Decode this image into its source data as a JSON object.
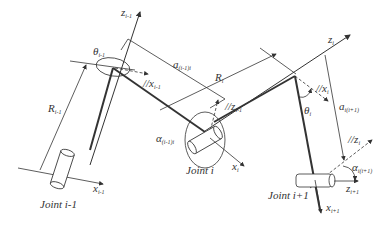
{
  "diagram": {
    "type": "robot-kinematics-dh-parameters",
    "joints": [
      {
        "label": "Joint i-1"
      },
      {
        "label": "Joint i"
      },
      {
        "label": "Joint i+1"
      }
    ],
    "labels": {
      "z_im1": {
        "base": "z",
        "sub": "i-1"
      },
      "theta_im1": {
        "base": "θ",
        "sub": "i-1"
      },
      "x_im1_parallel": {
        "base": "//x",
        "sub": "i-1"
      },
      "a_im1_i": {
        "base": "a",
        "sub": "(i-1)i"
      },
      "R_im1": {
        "base": "R",
        "sub": "i-1"
      },
      "x_im1": {
        "base": "x",
        "sub": "i-1"
      },
      "R_i": {
        "base": "R",
        "sub": "i"
      },
      "z_im1_parallel": {
        "base": "//z",
        "sub": "i-1"
      },
      "alpha_im1_i": {
        "base": "α",
        "sub": "(i-1)i"
      },
      "x_i": {
        "base": "x",
        "sub": "i"
      },
      "z_i": {
        "base": "z",
        "sub": "i"
      },
      "x_i_parallel": {
        "base": "//x",
        "sub": "i"
      },
      "theta_i": {
        "base": "θ",
        "sub": "i"
      },
      "a_i_ip1": {
        "base": "a",
        "sub": "i(i+1)"
      },
      "z_i_parallel": {
        "base": "//z",
        "sub": "i"
      },
      "alpha_i_ip1": {
        "base": "α",
        "sub": "i(i+1)"
      },
      "z_ip1": {
        "base": "z",
        "sub": "i+1"
      },
      "x_ip1": {
        "base": "x",
        "sub": "i+1"
      }
    },
    "colors": {
      "line": "#333333",
      "background": "#ffffff"
    }
  }
}
